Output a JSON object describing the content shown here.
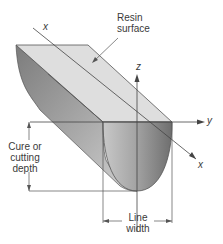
{
  "diagram": {
    "labels": {
      "resin_surface_line1": "Resin",
      "resin_surface_line2": "surface",
      "cure_depth_line1": "Cure or",
      "cure_depth_line2": "cutting",
      "cure_depth_line3": "depth",
      "line_width_line1": "Line",
      "line_width_line2": "width"
    },
    "axes": {
      "x_top": "x",
      "x_bottom": "x",
      "y": "y",
      "z": "z"
    },
    "colors": {
      "top_face": "#dcdcdc",
      "side_face_dark": "#8a8a8a",
      "side_face_light": "#c4c4c4",
      "front_face_dark": "#7a7a7a",
      "front_face_light": "#b8b8b8",
      "line": "#555555",
      "text": "#3a3a3a"
    }
  }
}
